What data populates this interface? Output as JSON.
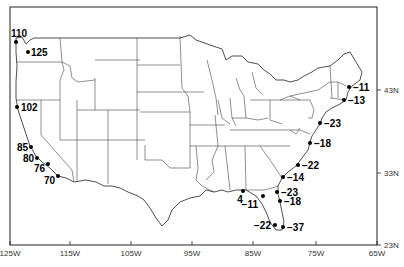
{
  "map": {
    "lon_ticks": [
      "125W",
      "115W",
      "105W",
      "95W",
      "85W",
      "75W",
      "65W"
    ],
    "lat_ticks": [
      "43N",
      "33N",
      "23N"
    ],
    "stations": [
      {
        "id": "s1",
        "value": "110",
        "x": 16,
        "y": 42,
        "lx": 11,
        "ly": 37,
        "anchor": "start"
      },
      {
        "id": "s2",
        "value": "125",
        "x": 28,
        "y": 52,
        "lx": 31,
        "ly": 56,
        "anchor": "start"
      },
      {
        "id": "s3",
        "value": "102",
        "x": 17,
        "y": 107,
        "lx": 21,
        "ly": 111,
        "anchor": "start"
      },
      {
        "id": "s4",
        "value": "85",
        "x": 31,
        "y": 147,
        "lx": 28,
        "ly": 151,
        "anchor": "end"
      },
      {
        "id": "s5",
        "value": "80",
        "x": 37,
        "y": 158,
        "lx": 34,
        "ly": 162,
        "anchor": "end"
      },
      {
        "id": "s6",
        "value": "76",
        "x": 48,
        "y": 164,
        "lx": 45,
        "ly": 172,
        "anchor": "end"
      },
      {
        "id": "s7",
        "value": "70",
        "x": 58,
        "y": 176,
        "lx": 55,
        "ly": 184,
        "anchor": "end"
      },
      {
        "id": "s8",
        "value": "−11",
        "x": 349,
        "y": 87,
        "lx": 353,
        "ly": 91,
        "anchor": "start"
      },
      {
        "id": "s9",
        "value": "−13",
        "x": 344,
        "y": 100,
        "lx": 348,
        "ly": 104,
        "anchor": "start"
      },
      {
        "id": "s10",
        "value": "−23",
        "x": 320,
        "y": 123,
        "lx": 324,
        "ly": 127,
        "anchor": "start"
      },
      {
        "id": "s11",
        "value": "−18",
        "x": 310,
        "y": 143,
        "lx": 314,
        "ly": 147,
        "anchor": "start"
      },
      {
        "id": "s12",
        "value": "−22",
        "x": 298,
        "y": 165,
        "lx": 302,
        "ly": 169,
        "anchor": "start"
      },
      {
        "id": "s13",
        "value": "−14",
        "x": 283,
        "y": 177,
        "lx": 287,
        "ly": 181,
        "anchor": "start"
      },
      {
        "id": "s14",
        "value": "−23",
        "x": 277,
        "y": 192,
        "lx": 281,
        "ly": 196,
        "anchor": "start"
      },
      {
        "id": "s15",
        "value": "−18",
        "x": 280,
        "y": 201,
        "lx": 284,
        "ly": 205,
        "anchor": "start"
      },
      {
        "id": "s16",
        "value": "4",
        "x": 243,
        "y": 191,
        "lx": 240,
        "ly": 203,
        "anchor": "middle"
      },
      {
        "id": "s17",
        "value": "−11",
        "x": 263,
        "y": 196,
        "lx": 258,
        "ly": 208,
        "anchor": "end"
      },
      {
        "id": "s18",
        "value": "−22",
        "x": 275,
        "y": 225,
        "lx": 271,
        "ly": 229,
        "anchor": "end"
      },
      {
        "id": "s19",
        "value": "−37",
        "x": 283,
        "y": 227,
        "lx": 287,
        "ly": 231,
        "anchor": "start"
      }
    ]
  }
}
